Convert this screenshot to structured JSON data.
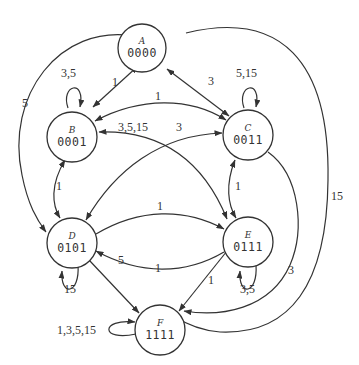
{
  "diagram": {
    "type": "state-transition-graph",
    "colors": {
      "stroke": "#333333",
      "background": "#ffffff"
    },
    "nodes": [
      {
        "id": "A",
        "name": "A",
        "code": "0000"
      },
      {
        "id": "B",
        "name": "B",
        "code": "0001"
      },
      {
        "id": "C",
        "name": "C",
        "code": "0011"
      },
      {
        "id": "D",
        "name": "D",
        "code": "0101"
      },
      {
        "id": "E",
        "name": "E",
        "code": "0111"
      },
      {
        "id": "F",
        "name": "F",
        "code": "1111"
      }
    ],
    "edges": [
      {
        "from": "A",
        "to": "B",
        "label": "1",
        "bidirectional": true
      },
      {
        "from": "A",
        "to": "C",
        "label": "3",
        "bidirectional": true
      },
      {
        "from": "A",
        "to": "D",
        "label": "5",
        "bidirectional": true
      },
      {
        "from": "A",
        "to": "F",
        "label": "15"
      },
      {
        "from": "B",
        "to": "B",
        "label": "3,5"
      },
      {
        "from": "B",
        "to": "C",
        "label": "1",
        "bidirectional": true
      },
      {
        "from": "B",
        "to": "E",
        "label": "3,5,15",
        "bidirectional": true
      },
      {
        "from": "B",
        "to": "D",
        "label": "1",
        "bidirectional": true
      },
      {
        "from": "C",
        "to": "C",
        "label": "5,15"
      },
      {
        "from": "C",
        "to": "D",
        "label": "3",
        "bidirectional": true
      },
      {
        "from": "C",
        "to": "E",
        "label": "1",
        "bidirectional": true
      },
      {
        "from": "C",
        "to": "F",
        "label": "3"
      },
      {
        "from": "D",
        "to": "E",
        "label": "1"
      },
      {
        "from": "E",
        "to": "D",
        "label": "1"
      },
      {
        "from": "D",
        "to": "D",
        "label": "15"
      },
      {
        "from": "D",
        "to": "F",
        "label": "5"
      },
      {
        "from": "E",
        "to": "E",
        "label": "3,5"
      },
      {
        "from": "E",
        "to": "F",
        "label": "1"
      },
      {
        "from": "F",
        "to": "F",
        "label": "1,3,5,15"
      }
    ]
  }
}
